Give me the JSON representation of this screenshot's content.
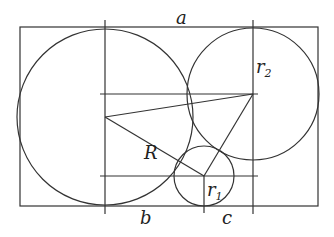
{
  "diagram": {
    "stroke_color": "#333333",
    "labels": {
      "a": "a",
      "b": "b",
      "c": "c",
      "R": "R",
      "r1": "r",
      "r1_sub": "1",
      "r2": "r",
      "r2_sub": "2"
    },
    "rectangle": {
      "x": 20,
      "y": 27,
      "width": 298,
      "height": 179
    },
    "circles": [
      {
        "name": "big-circle-R",
        "cx": 105,
        "cy": 117,
        "r": 88
      },
      {
        "name": "circle-r2",
        "cx": 253,
        "cy": 94,
        "r": 66
      },
      {
        "name": "circle-r1",
        "cx": 204,
        "cy": 176,
        "r": 30
      }
    ]
  }
}
